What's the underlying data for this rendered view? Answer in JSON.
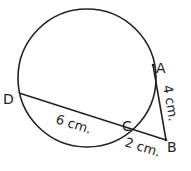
{
  "diagram": {
    "type": "geometry",
    "points": {
      "A": "A",
      "B": "B",
      "C": "C",
      "D": "D"
    },
    "labels": {
      "dc_length": "6 cm.",
      "cb_length": "2 cm.",
      "ab_length": "4 cm."
    },
    "stroke_color": "#222222"
  }
}
